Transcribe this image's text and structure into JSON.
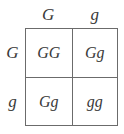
{
  "diagram": {
    "type": "punnett-square",
    "colors": {
      "border": "#6b6b6b",
      "text": "#3a3a3a",
      "background": "#ffffff"
    },
    "column_headers": [
      {
        "label": "G"
      },
      {
        "label": "g"
      }
    ],
    "row_headers": [
      {
        "label": "G"
      },
      {
        "label": "g"
      }
    ],
    "cells": [
      [
        {
          "label": "GG"
        },
        {
          "label": "Gg"
        }
      ],
      [
        {
          "label": "Gg"
        },
        {
          "label": "gg"
        }
      ]
    ]
  }
}
